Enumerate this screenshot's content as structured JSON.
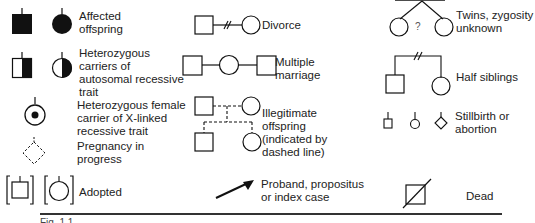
{
  "legend": {
    "affected": "Affected offspring",
    "heterozygous_autosomal": "Heterozygous carriers of autosomal recessive trait",
    "heterozygous_x": "Heterozygous female carrier of X-linked recessive trait",
    "pregnancy": "Pregnancy in progress",
    "adopted": "Adopted",
    "divorce": "Divorce",
    "multiple_marriage": "Multiple marriage",
    "illegitimate": "Illegitimate offspring (indicated by dashed line)",
    "proband": "Proband, propositus or index case",
    "twins": "Twins, zygosity unknown",
    "twins_mark": "?",
    "half_siblings": "Half siblings",
    "stillbirth": "Stillbirth or abortion",
    "dead": "Dead"
  },
  "caption": "Fig. 1.1 ..."
}
